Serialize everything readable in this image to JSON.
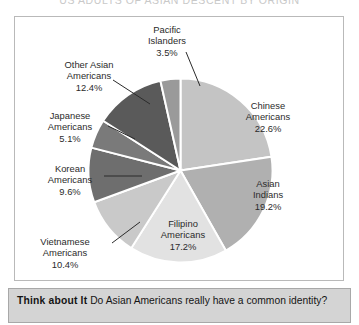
{
  "chart_heading": "US ADULTS OF ASIAN DESCENT BY ORIGIN",
  "caption": {
    "lead": "Think about It",
    "text": "Do Asian Americans really have a common identity?"
  },
  "colors": {
    "chinese": "#c4c4c4",
    "asian_indians": "#b0b0b0",
    "filipino": "#e2e2e2",
    "vietnamese": "#c9c9c9",
    "korean": "#6e6e6e",
    "japanese": "#7a7a7a",
    "other_asian": "#5a5a5a",
    "pacific_islanders": "#9a9a9a",
    "frame_border": "#b9b9b9",
    "caption_bg": "#d4d4d4",
    "slice_divider": "#ffffff",
    "leader_line": "#2b2b2b"
  },
  "chart_data": {
    "type": "pie",
    "title": "US ADULTS OF ASIAN DESCENT BY ORIGIN",
    "xlabel": "",
    "ylabel": "",
    "legend": "none",
    "labels_on_slices": true,
    "categories": [
      "Chinese Americans",
      "Asian Indians",
      "Filipino Americans",
      "Vietnamese Americans",
      "Korean Americans",
      "Japanese Americans",
      "Other Asian Americans",
      "Pacific Islanders"
    ],
    "values": [
      22.6,
      19.2,
      17.2,
      10.4,
      9.6,
      5.1,
      12.4,
      3.5
    ],
    "value_labels": [
      "22.6%",
      "19.2%",
      "17.2%",
      "10.4%",
      "9.6%",
      "5.1%",
      "12.4%",
      "3.5%"
    ],
    "units": "percent",
    "total": 100.0
  },
  "slices": [
    {
      "key": "chinese",
      "name_line1": "Chinese",
      "name_line2": "Americans",
      "percent_label": "22.6%",
      "percent": 22.6,
      "color": "#c4c4c4",
      "leader_line": false
    },
    {
      "key": "asian_indians",
      "name_line1": "Asian",
      "name_line2": "Indians",
      "percent_label": "19.2%",
      "percent": 19.2,
      "color": "#b0b0b0",
      "leader_line": false
    },
    {
      "key": "filipino",
      "name_line1": "Filipino",
      "name_line2": "Americans",
      "percent_label": "17.2%",
      "percent": 17.2,
      "color": "#e2e2e2",
      "leader_line": false
    },
    {
      "key": "vietnamese",
      "name_line1": "Vietnamese",
      "name_line2": "Americans",
      "percent_label": "10.4%",
      "percent": 10.4,
      "color": "#c9c9c9",
      "leader_line": true
    },
    {
      "key": "korean",
      "name_line1": "Korean",
      "name_line2": "Americans",
      "percent_label": "9.6%",
      "percent": 9.6,
      "color": "#6e6e6e",
      "leader_line": true
    },
    {
      "key": "japanese",
      "name_line1": "Japanese",
      "name_line2": "Americans",
      "percent_label": "5.1%",
      "percent": 5.1,
      "color": "#7a7a7a",
      "leader_line": true
    },
    {
      "key": "other_asian",
      "name_line1": "Other Asian",
      "name_line2": "Americans",
      "percent_label": "12.4%",
      "percent": 12.4,
      "color": "#5a5a5a",
      "leader_line": true
    },
    {
      "key": "pacific_islanders",
      "name_line1": "Pacific",
      "name_line2": "Islanders",
      "percent_label": "3.5%",
      "percent": 3.5,
      "color": "#9a9a9a",
      "leader_line": true
    }
  ]
}
